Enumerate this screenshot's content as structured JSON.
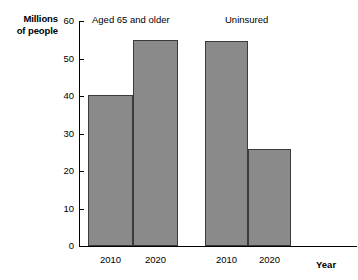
{
  "chart_data": {
    "type": "bar",
    "title": "",
    "xlabel": "Year",
    "ylabel": "Millions of people",
    "ylabel_line1": "Millions",
    "ylabel_line2": "of people",
    "ylim": [
      0,
      60
    ],
    "yticks": [
      0,
      10,
      20,
      30,
      40,
      50,
      60
    ],
    "ytick_labels": [
      "0",
      "10",
      "20",
      "30",
      "40",
      "50",
      "60"
    ],
    "grid": false,
    "legend": "none",
    "groups": [
      {
        "label": "Aged 65 and older",
        "categories": [
          "2010",
          "2020"
        ],
        "values": [
          40.3,
          55.0
        ]
      },
      {
        "label": "Uninsured",
        "categories": [
          "2010",
          "2020"
        ],
        "values": [
          54.8,
          26.0
        ]
      }
    ],
    "categories": [
      "2010",
      "2020",
      "2010",
      "2020"
    ],
    "values": [
      40.3,
      55.0,
      54.8,
      26.0
    ],
    "bar_color": "#8a8a8a",
    "bar_edge_color": "#3a3a3a",
    "axis_color": "#000000",
    "background_color": "#ffffff"
  },
  "bars": [
    {
      "label": "2010",
      "group": "Aged 65 and older",
      "value": 40.3,
      "left": 88,
      "width": 45
    },
    {
      "label": "2020",
      "group": "Aged 65 and older",
      "value": 55.0,
      "left": 133,
      "width": 45
    },
    {
      "label": "2010",
      "group": "Uninsured",
      "value": 54.8,
      "left": 205,
      "width": 43
    },
    {
      "label": "2020",
      "group": "Uninsured",
      "value": 26.0,
      "left": 248,
      "width": 43
    }
  ],
  "group_labels": [
    {
      "text": "Aged 65 and older",
      "left": 92
    },
    {
      "text": "Uninsured",
      "left": 225
    }
  ]
}
